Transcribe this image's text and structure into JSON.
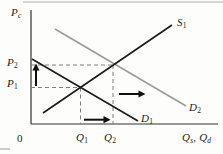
{
  "figure": {
    "type": "supply-demand-diagram",
    "labels": {
      "y_axis": {
        "base": "P",
        "sub": "c"
      },
      "price2": {
        "base": "P",
        "sub": "2"
      },
      "price1": {
        "base": "P",
        "sub": "1"
      },
      "origin": "0",
      "qty1": {
        "base": "Q",
        "sub": "1"
      },
      "qty2": {
        "base": "Q",
        "sub": "2"
      },
      "x_axis": {
        "base1": "Q",
        "sub1": "s",
        "sep": ", ",
        "base2": "Q",
        "sub2": "d"
      },
      "supply1": {
        "base": "S",
        "sub": "1"
      },
      "demand1": {
        "base": "D",
        "sub": "1"
      },
      "demand2": {
        "base": "D",
        "sub": "2"
      }
    },
    "curves": [
      {
        "id": "S1",
        "role": "supply",
        "direction": "upward-sloping"
      },
      {
        "id": "D1",
        "role": "original demand",
        "direction": "downward-sloping"
      },
      {
        "id": "D2",
        "role": "shifted demand",
        "direction": "downward-sloping"
      }
    ],
    "guides": [
      "P2-horizontal-dashed",
      "P1-horizontal-dashed",
      "Q1-vertical-dashed",
      "Q2-vertical-dashed"
    ],
    "arrows": [
      {
        "id": "price-up",
        "direction": "up",
        "meaning": "price rises P1 to P2"
      },
      {
        "id": "demand-shift-right",
        "direction": "right",
        "meaning": "demand shifts D1 to D2"
      },
      {
        "id": "quantity-right",
        "direction": "right",
        "meaning": "quantity rises Q1 to Q2"
      }
    ],
    "colors": {
      "background": "#fdfdfb",
      "supply_line": "#1a1a1a",
      "demand1_line": "#1a1a1a",
      "demand2_line": "#9b9b9b",
      "dashed_guide": "#7f7f7f",
      "axis": "#303030",
      "arrow": "#0f0f0f",
      "page_rule": "#c8c8c8",
      "text": "#1c1c1c"
    }
  }
}
